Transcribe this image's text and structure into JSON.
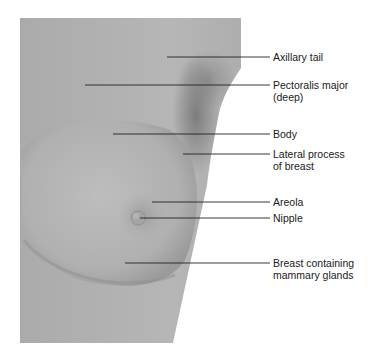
{
  "figure": {
    "type": "anatomical-illustration",
    "colors": {
      "skin_light": "#b9b9b9",
      "skin_mid": "#a3a3a3",
      "skin_dark": "#7e7e7e",
      "leader_line": "#222222",
      "text": "#1a1a1a"
    }
  },
  "labels": [
    {
      "id": "axillary-tail",
      "text": "Axillary tail",
      "y": 57,
      "x_start": 167
    },
    {
      "id": "pectoralis-major",
      "text": "Pectoralis major\n(deep)",
      "y": 85,
      "x_start": 85
    },
    {
      "id": "body",
      "text": "Body",
      "y": 134,
      "x_start": 113
    },
    {
      "id": "lateral-process",
      "text": "Lateral process\nof breast",
      "y": 154,
      "x_start": 183
    },
    {
      "id": "areola",
      "text": "Areola",
      "y": 202,
      "x_start": 152
    },
    {
      "id": "nipple",
      "text": "Nipple",
      "y": 218,
      "x_start": 140
    },
    {
      "id": "breast-mammary-glands",
      "text": "Breast containing\nmammary glands",
      "y": 263,
      "x_start": 125
    }
  ]
}
